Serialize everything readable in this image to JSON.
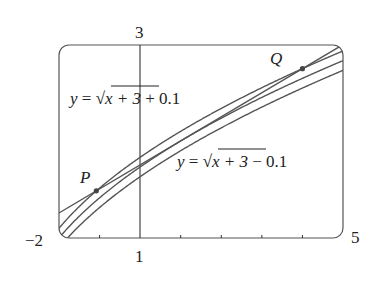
{
  "chart_data": {
    "type": "line",
    "title": "",
    "xlabel": "",
    "ylabel": "",
    "xlim": [
      -2,
      5
    ],
    "ylim": [
      1,
      3
    ],
    "grid": false,
    "x_ticks": [
      -1,
      0,
      1,
      2,
      3,
      4
    ],
    "tick_labels": {
      "x_min": "−2",
      "x_max": "5",
      "y_min": "1",
      "y_max": "3"
    },
    "series": [
      {
        "name": "y = √(x+3) + 0.1",
        "formula": "sqrt(x+3)+0.1"
      },
      {
        "name": "y = √(x+3)",
        "formula": "sqrt(x+3)"
      },
      {
        "name": "y = √(x+3) − 0.1",
        "formula": "sqrt(x+3)-0.1"
      },
      {
        "name": "secant PQ",
        "type": "line",
        "points": [
          [
            -1.08,
            1.486
          ],
          [
            4.0,
            2.746
          ]
        ]
      }
    ],
    "points": [
      {
        "label": "P",
        "x": -1.08,
        "y": 1.486
      },
      {
        "label": "Q",
        "x": 4.0,
        "y": 2.746
      }
    ],
    "annotations": [
      {
        "text_parts": [
          "y",
          " = ",
          "x + 3",
          " + 0.1"
        ],
        "position": "upper-left"
      },
      {
        "text_parts": [
          "y",
          " = ",
          "x + 3",
          " − 0.1"
        ],
        "position": "center-right"
      }
    ]
  },
  "labels": {
    "x_min": "−2",
    "x_max": "5",
    "y_min": "1",
    "y_max": "3",
    "P": "P",
    "Q": "Q",
    "eq_upper": {
      "y": "y",
      "eq": " = ",
      "rad": "x + 3",
      "tail": " + 0.1"
    },
    "eq_lower": {
      "y": "y",
      "eq": " = ",
      "rad": "x + 3",
      "tail": " − 0.1"
    }
  },
  "colors": {
    "curve": "#555555",
    "frame": "#555555",
    "point": "#444444"
  }
}
